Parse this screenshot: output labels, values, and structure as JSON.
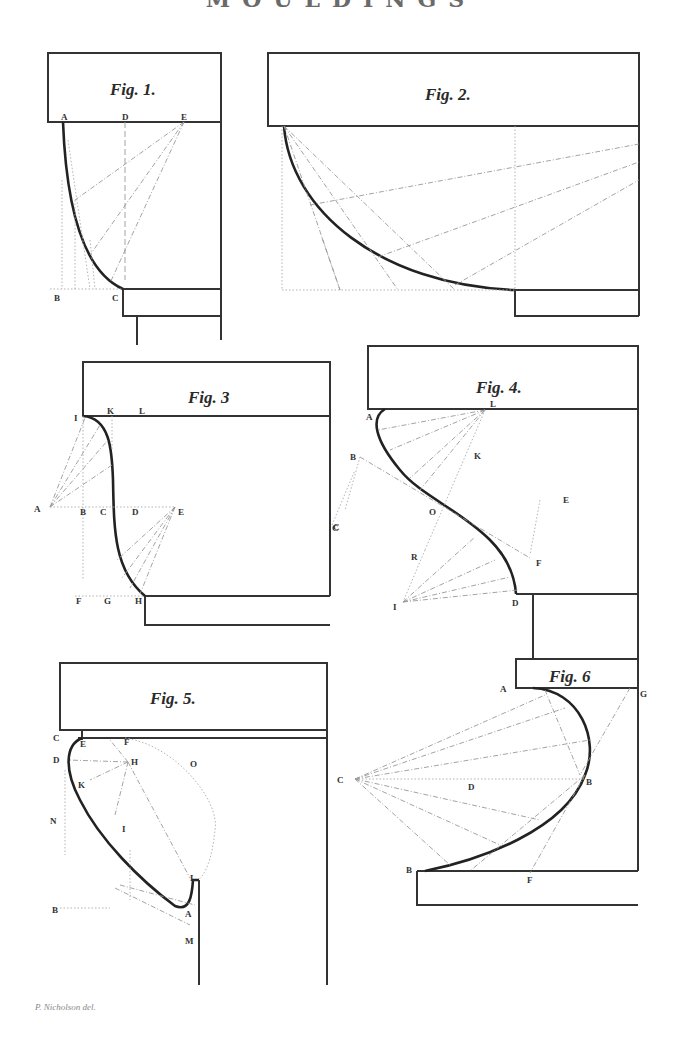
{
  "plate": {
    "title": "MOULDINGS",
    "credit": "P. Nicholson del."
  },
  "figures": [
    {
      "id": "fig1",
      "label": "Fig. 1.",
      "points": [
        "A",
        "D",
        "E",
        "B",
        "C"
      ]
    },
    {
      "id": "fig2",
      "label": "Fig. 2.",
      "points": []
    },
    {
      "id": "fig3",
      "label": "Fig. 3",
      "points": [
        "I",
        "K",
        "L",
        "A",
        "B",
        "C",
        "D",
        "E",
        "F",
        "G",
        "H",
        "C"
      ]
    },
    {
      "id": "fig4",
      "label": "Fig. 4.",
      "points": [
        "A",
        "L",
        "B",
        "K",
        "C",
        "O",
        "E",
        "R",
        "F",
        "I",
        "D"
      ]
    },
    {
      "id": "fig5",
      "label": "Fig. 5.",
      "points": [
        "C",
        "E",
        "F",
        "D",
        "H",
        "O",
        "K",
        "N",
        "I",
        "L",
        "B",
        "A",
        "M"
      ]
    },
    {
      "id": "fig6",
      "label": "Fig. 6",
      "points": [
        "A",
        "G",
        "C",
        "D",
        "B",
        "B",
        "F"
      ]
    }
  ]
}
